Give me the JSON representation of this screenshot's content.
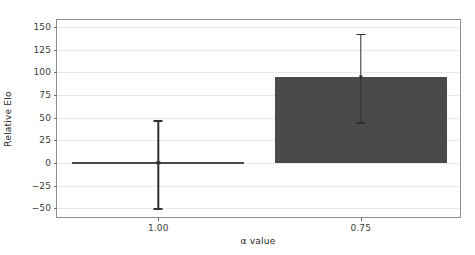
{
  "chart_data": {
    "type": "bar",
    "title": "",
    "xlabel": "α value",
    "ylabel": "Relative Elo",
    "categories": [
      "1.00",
      "0.75"
    ],
    "values": [
      0,
      95
    ],
    "errors": [
      {
        "category": "1.00",
        "value": 0,
        "low": -50,
        "high": 47
      },
      {
        "category": "0.75",
        "value": 95,
        "low": 45,
        "high": 143
      }
    ],
    "ylim": [
      -62,
      158
    ],
    "yticks": [
      150,
      125,
      100,
      75,
      50,
      25,
      0,
      -25,
      -50
    ],
    "ytick_labels": [
      "150",
      "125",
      "100",
      "75",
      "50",
      "25",
      "0",
      "−25",
      "−50"
    ],
    "xticks": [
      "1.00",
      "0.75"
    ],
    "grid": true,
    "grid_axis": "y",
    "legend": false,
    "bar_color": "#4a4a4a",
    "errorbar_color": "#303030",
    "gridline_color": "#e9e9ec",
    "axes_color": "#8d8d8d",
    "background": "#ffffff"
  }
}
